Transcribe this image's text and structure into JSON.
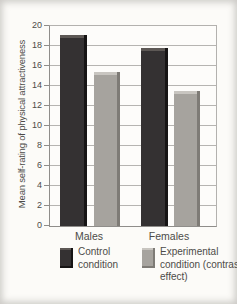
{
  "chart_data": {
    "type": "bar",
    "title": "",
    "ylabel": "Mean self-rating of physical attractiveness",
    "xlabel": "",
    "ylim": [
      0,
      20
    ],
    "ytick_step": 2,
    "yticks": [
      0,
      2,
      4,
      6,
      8,
      10,
      12,
      14,
      16,
      18,
      20
    ],
    "grid": true,
    "legend_position": "bottom",
    "categories": [
      "Males",
      "Females"
    ],
    "series": [
      {
        "name": "Control condition",
        "values": [
          19.1,
          17.8
        ],
        "color": "#343132",
        "bevel_top": "#5d5855",
        "bevel_right": "#161414"
      },
      {
        "name": "Experimental condition (contrast effect)",
        "values": [
          15.4,
          13.5
        ],
        "color": "#a6a39e",
        "bevel_top": "#c8c5c0",
        "bevel_right": "#7e7b76"
      }
    ]
  },
  "colors": {
    "gridline": "#b6b4b1",
    "axis": "#8f8d8a",
    "text": "#4d4b48",
    "plot_background": "#fdfcfa"
  }
}
